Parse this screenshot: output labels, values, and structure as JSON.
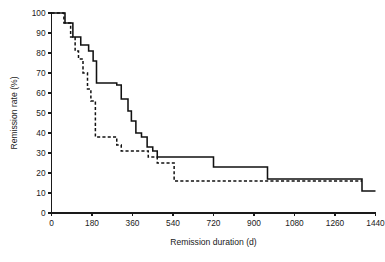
{
  "chart_data": {
    "type": "line",
    "subtype": "kaplan-meier-step",
    "title": "",
    "xlabel": "Remission duration (d)",
    "ylabel": "Remission rate (%)",
    "xlim": [
      0,
      1440
    ],
    "ylim": [
      0,
      100
    ],
    "xticks": [
      0,
      180,
      360,
      540,
      720,
      900,
      1080,
      1260,
      1440
    ],
    "xtick_labels": [
      "0",
      "180",
      "360",
      "540",
      "720",
      "900",
      "1080",
      "1260",
      "1440"
    ],
    "yticks": [
      0,
      10,
      20,
      30,
      40,
      50,
      60,
      70,
      80,
      90,
      100
    ],
    "ytick_labels": [
      "0",
      "10",
      "20",
      "30",
      "40",
      "50",
      "60",
      "70",
      "80",
      "90",
      "100"
    ],
    "grid": false,
    "legend": "none",
    "series": [
      {
        "name": "solid-curve",
        "style": "solid",
        "color": "#111111",
        "x": [
          0,
          60,
          60,
          95,
          95,
          130,
          130,
          165,
          165,
          185,
          185,
          200,
          200,
          290,
          290,
          310,
          310,
          340,
          340,
          355,
          355,
          375,
          375,
          400,
          400,
          425,
          425,
          450,
          450,
          470,
          470,
          720,
          720,
          960,
          960,
          1380,
          1380,
          1440
        ],
        "y": [
          100,
          100,
          95,
          95,
          88,
          88,
          84,
          84,
          81,
          81,
          76,
          76,
          65,
          65,
          64,
          64,
          57,
          57,
          51,
          51,
          46,
          46,
          40,
          40,
          38,
          38,
          33,
          33,
          31,
          31,
          28,
          28,
          23,
          23,
          17,
          17,
          11,
          11
        ]
      },
      {
        "name": "dashed-curve",
        "style": "dashed",
        "color": "#111111",
        "x": [
          0,
          55,
          55,
          85,
          85,
          105,
          105,
          120,
          120,
          140,
          140,
          160,
          160,
          175,
          175,
          195,
          195,
          290,
          290,
          310,
          310,
          430,
          430,
          470,
          470,
          545,
          545,
          1380
        ],
        "y": [
          100,
          100,
          95,
          95,
          88,
          88,
          81,
          81,
          77,
          77,
          70,
          70,
          62,
          62,
          56,
          56,
          38,
          38,
          34,
          34,
          31,
          31,
          28,
          28,
          25,
          25,
          16,
          16
        ]
      }
    ]
  },
  "axes": {
    "x_title": "Remission duration (d)",
    "y_title": "Remission rate (%)"
  }
}
